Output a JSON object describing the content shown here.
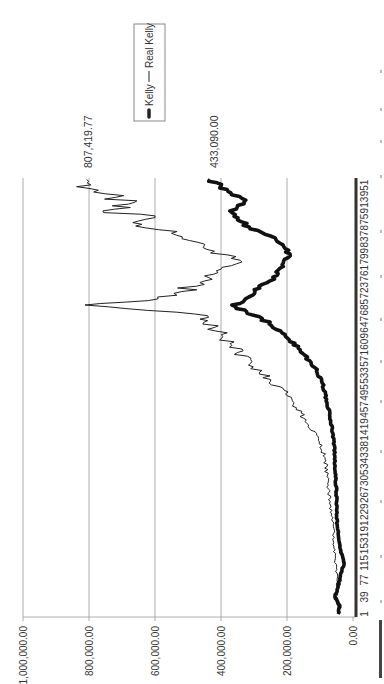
{
  "chart_data": {
    "type": "line",
    "orientation": "rotated-90-ccw",
    "title": "",
    "xlabel": "",
    "ylabel": "",
    "ylim": [
      0,
      1000000
    ],
    "yticks": [
      "0.00",
      "200,000.00",
      "400,000.00",
      "600,000.00",
      "800,000.00",
      "1,000,000.00"
    ],
    "xticks": [
      "1",
      "39",
      "77",
      "115",
      "153",
      "191",
      "229",
      "267",
      "305",
      "343",
      "381",
      "419",
      "457",
      "495",
      "533",
      "571",
      "609",
      "647",
      "685",
      "723",
      "761",
      "799",
      "837",
      "875",
      "913",
      "951"
    ],
    "grid": true,
    "legend": {
      "position": "top-right",
      "entries": [
        "Kelly",
        "Real Kelly"
      ]
    },
    "annotations": [
      {
        "series": "Real Kelly",
        "text": "807,419.77"
      },
      {
        "series": "Kelly",
        "text": "433,090.00"
      }
    ],
    "series": [
      {
        "name": "Kelly",
        "style": "thick",
        "x": [
          1,
          20,
          40,
          60,
          80,
          115,
          150,
          200,
          250,
          300,
          350,
          400,
          440,
          480,
          520,
          550,
          590,
          620,
          660,
          690,
          700,
          720,
          740,
          760,
          780,
          800,
          820,
          840,
          860,
          880,
          900,
          920,
          940,
          955,
          970
        ],
        "values": [
          45000,
          40000,
          55000,
          45000,
          40000,
          27000,
          40000,
          48000,
          50000,
          52000,
          55000,
          60000,
          70000,
          80000,
          95000,
          115000,
          160000,
          205000,
          275000,
          367000,
          330000,
          297000,
          260000,
          227000,
          215000,
          190000,
          210000,
          236000,
          312000,
          350000,
          373000,
          330000,
          370000,
          400000,
          433090
        ]
      },
      {
        "name": "Real Kelly",
        "style": "thin",
        "x": [
          1,
          40,
          80,
          120,
          200,
          280,
          350,
          400,
          430,
          480,
          520,
          560,
          600,
          640,
          670,
          690,
          700,
          720,
          740,
          770,
          790,
          810,
          830,
          850,
          870,
          885,
          900,
          915,
          930,
          950,
          970
        ],
        "values": [
          45000,
          50000,
          48000,
          55000,
          60000,
          75000,
          85000,
          110000,
          145000,
          185000,
          250000,
          310000,
          367000,
          420000,
          480000,
          812000,
          620000,
          520000,
          464000,
          400000,
          342000,
          420000,
          470000,
          550000,
          640000,
          600000,
          758000,
          680000,
          720000,
          800000,
          807419.77
        ]
      }
    ]
  },
  "legend": {
    "kelly": "Kelly",
    "real_kelly": "Real Kelly"
  },
  "annotations": {
    "real_kelly_end": "807,419.77",
    "kelly_end": "433,090.00"
  }
}
